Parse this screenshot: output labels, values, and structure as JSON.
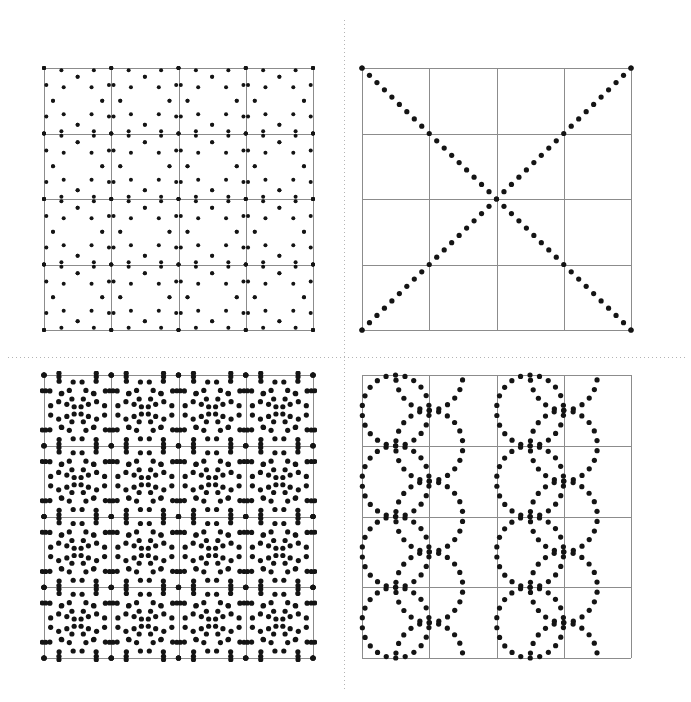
{
  "figure": {
    "title": "",
    "background_color": "#ffffff",
    "width": 691,
    "height": 702,
    "dot_color": "#141414",
    "dot_radius_px": 2.2,
    "grid_line_color": "#8c8c8c",
    "grid_line_width": 1,
    "frame_color": "#8c8c8c",
    "divider_color": "#b4b4b4",
    "divider_style": "dotted",
    "divider_width": 1
  },
  "dividers": {
    "vertical": {
      "name": "vertical-dotted-divider",
      "x": 344,
      "y0": 20,
      "y1": 690,
      "dash": "1,3"
    },
    "horizontal": {
      "name": "horizontal-dotted-divider",
      "y": 357,
      "x0": 8,
      "x1": 685,
      "dash": "1,3"
    }
  },
  "panels": [
    {
      "id": "top-left",
      "name": "panel-top-left",
      "label": "",
      "x": 44,
      "y": 68,
      "w": 269,
      "h": 262,
      "grid_cols": 4,
      "grid_rows": 4,
      "pattern": "circles-at-nodes-radius-one-cell",
      "circle_radius_cells": 1.0,
      "dots_per_circle": 24,
      "dot_radius_px": 2.0,
      "phase_deg": 0,
      "node_origin": "grid-intersections-inclusive"
    },
    {
      "id": "top-right",
      "name": "panel-top-right",
      "label": "",
      "x": 362,
      "y": 68,
      "w": 269,
      "h": 262,
      "grid_cols": 4,
      "grid_rows": 4,
      "pattern": "diagonal-diamond-lattice",
      "slope": 1,
      "period_cells": 2,
      "dots_per_leg": 18,
      "dot_radius_px": 2.6
    },
    {
      "id": "bottom-left",
      "name": "panel-bottom-left",
      "label": "",
      "x": 44,
      "y": 375,
      "w": 269,
      "h": 283,
      "grid_cols": 4,
      "grid_rows": 4,
      "pattern": "double-circle-rosette-at-nodes",
      "circle_radius_cells": [
        1.0,
        0.78
      ],
      "dots_per_circle": 28,
      "dot_radius_px": 2.6,
      "phase_deg": 0
    },
    {
      "id": "bottom-right",
      "name": "panel-bottom-right",
      "label": "",
      "x": 362,
      "y": 375,
      "w": 269,
      "h": 283,
      "grid_cols": 4,
      "grid_rows": 4,
      "pattern": "inscribed-circles-centers-and-corners",
      "circle_radius_cells": 0.5,
      "dots_per_circle": 22,
      "dot_radius_px": 2.6,
      "phase_deg": 8
    }
  ],
  "chart_data": {
    "type": "scatter",
    "title": "",
    "subtitle": "",
    "xlabel": "",
    "ylabel": "",
    "grid": true,
    "legend": null,
    "panel_summaries": [
      {
        "panel": "top-left",
        "motif": "overlapping circles of radius one grid cell centred on every grid node",
        "tick_values": [
          0,
          1,
          2,
          3,
          4
        ]
      },
      {
        "panel": "top-right",
        "motif": "diagonal lines of slope plus and minus one forming a diamond lattice",
        "tick_values": [
          0,
          1,
          2,
          3,
          4
        ]
      },
      {
        "panel": "bottom-left",
        "motif": "two concentric circle families per node forming a rosette lattice",
        "tick_values": [
          0,
          1,
          2,
          3,
          4
        ]
      },
      {
        "panel": "bottom-right",
        "motif": "circles inscribed in alternating cells, centred on cell centres and on cell corners",
        "tick_values": [
          0,
          1,
          2,
          3,
          4
        ]
      }
    ],
    "axis_ranges": {
      "x": [
        0,
        4
      ],
      "y": [
        0,
        4
      ]
    }
  }
}
